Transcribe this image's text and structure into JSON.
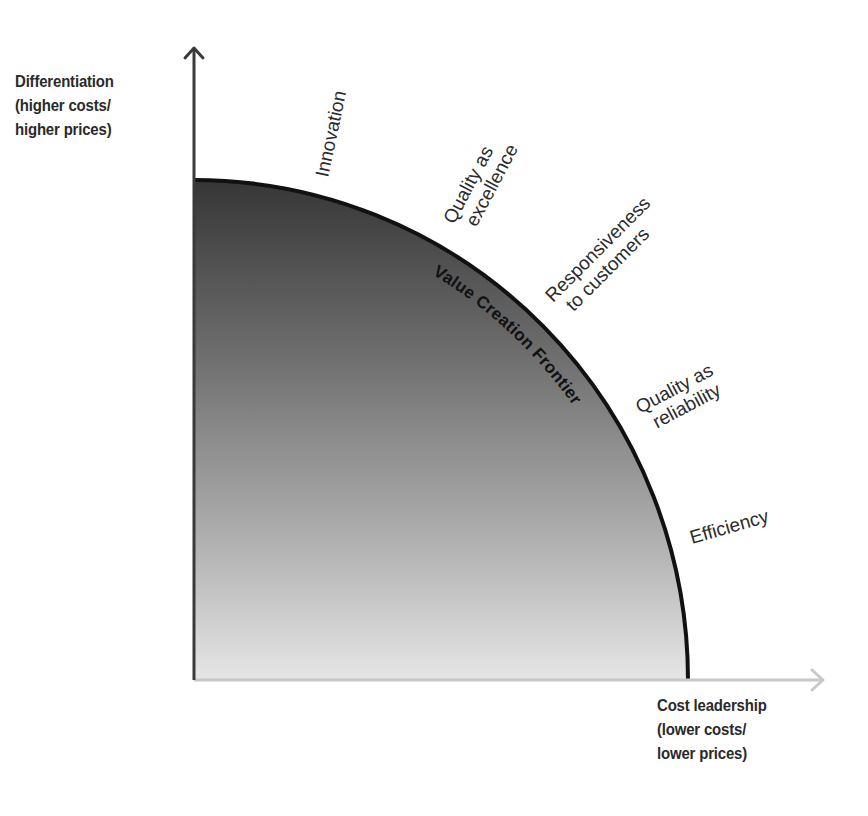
{
  "diagram": {
    "y_axis": {
      "title_lines": [
        "Differentiation",
        "(higher costs/",
        "higher prices)"
      ]
    },
    "x_axis": {
      "title_lines": [
        "Cost leadership",
        "(lower costs/",
        "lower prices)"
      ]
    },
    "frontier": {
      "label": "Value Creation Frontier",
      "stroke_color": "#111111",
      "fill_gradient_top": "#3a3a3a",
      "fill_gradient_bottom": "#e4e4e4"
    },
    "drivers": [
      {
        "lines": [
          "Innovation"
        ]
      },
      {
        "lines": [
          "Quality as",
          "excellence"
        ]
      },
      {
        "lines": [
          "Responsiveness",
          "to customers"
        ]
      },
      {
        "lines": [
          "Quality as",
          "reliability"
        ]
      },
      {
        "lines": [
          "Efficiency"
        ]
      }
    ],
    "colors": {
      "y_axis": "#3a3a3a",
      "x_axis": "#c8c8c8",
      "text": "#2b2b2b"
    }
  }
}
